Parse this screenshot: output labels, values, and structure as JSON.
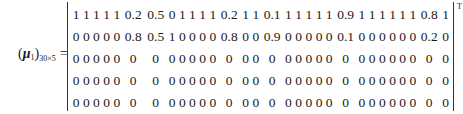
{
  "equation": {
    "lhs": {
      "symbol": "μ",
      "subscript_index": "1",
      "dimension": "30×5",
      "equals": "="
    },
    "transpose_mark": "T",
    "matrix": {
      "rows": [
        [
          "1",
          "1",
          "1",
          "1",
          "1",
          "0.2",
          "0.5",
          "0",
          "1",
          "1",
          "1",
          "1",
          "0.2",
          "1",
          "1",
          "0.1",
          "1",
          "1",
          "1",
          "1",
          "1",
          "0.9",
          "1",
          "1",
          "1",
          "1",
          "1",
          "1",
          "0.8",
          "1"
        ],
        [
          "0",
          "0",
          "0",
          "0",
          "0",
          "0.8",
          "0.5",
          "1",
          "0",
          "0",
          "0",
          "0",
          "0.8",
          "0",
          "0",
          "0.9",
          "0",
          "0",
          "0",
          "0",
          "0",
          "0.1",
          "0",
          "0",
          "0",
          "0",
          "0",
          "0",
          "0.2",
          "0"
        ],
        [
          "0",
          "0",
          "0",
          "0",
          "0",
          "0",
          "0",
          "0",
          "0",
          "0",
          "0",
          "0",
          "0",
          "0",
          "0",
          "0",
          "0",
          "0",
          "0",
          "0",
          "0",
          "0",
          "0",
          "0",
          "0",
          "0",
          "0",
          "0",
          "0",
          "0"
        ],
        [
          "0",
          "0",
          "0",
          "0",
          "0",
          "0",
          "0",
          "0",
          "0",
          "0",
          "0",
          "0",
          "0",
          "0",
          "0",
          "0",
          "0",
          "0",
          "0",
          "0",
          "0",
          "0",
          "0",
          "0",
          "0",
          "0",
          "0",
          "0",
          "0",
          "0"
        ],
        [
          "0",
          "0",
          "0",
          "0",
          "0",
          "0",
          "0",
          "0",
          "0",
          "0",
          "0",
          "0",
          "0",
          "0",
          "0",
          "0",
          "0",
          "0",
          "0",
          "0",
          "0",
          "0",
          "0",
          "0",
          "0",
          "0",
          "0",
          "0",
          "0",
          "0"
        ]
      ]
    }
  }
}
